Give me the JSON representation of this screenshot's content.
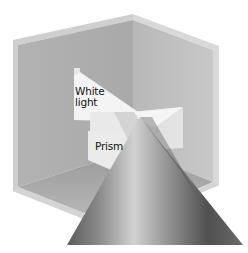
{
  "diagram": {
    "labels": {
      "white_light": "White\nlight",
      "white_light_line1": "White",
      "white_light_line2": "light",
      "prism": "Prism"
    },
    "colors": {
      "background": "#ffffff",
      "wall_left": "#b4b4b4",
      "wall_right": "#c2c2c2",
      "floor": "#a6a6a6",
      "frame_edge": "#d6d6d6",
      "beam": "#f2f2f2",
      "cone_dark": "#6e6e6e",
      "cone_light": "#d0d0d0"
    }
  }
}
